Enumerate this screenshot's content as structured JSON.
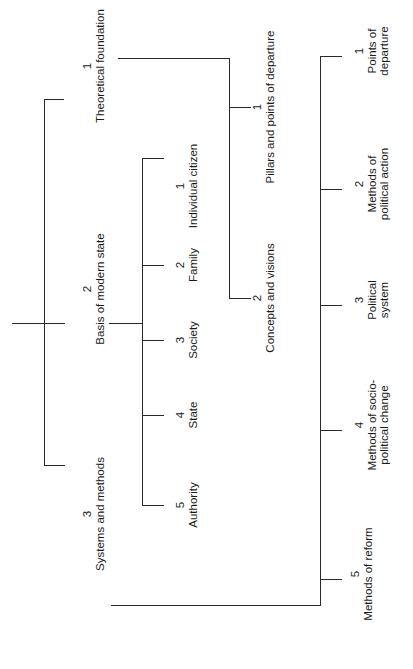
{
  "diagram": {
    "orientation": "rotated-90-ccw",
    "root": {
      "branches": [
        {
          "number": "1",
          "label": "Theoretical foundation"
        },
        {
          "number": "2",
          "label": "Basis of modern state"
        },
        {
          "number": "3",
          "label": "Systems and methods"
        }
      ]
    },
    "basis_of_modern_state": {
      "children": [
        {
          "number": "1",
          "label": "Individual citizen"
        },
        {
          "number": "2",
          "label": "Family"
        },
        {
          "number": "3",
          "label": "Society"
        },
        {
          "number": "4",
          "label": "State"
        },
        {
          "number": "5",
          "label": "Authority"
        }
      ]
    },
    "theoretical_foundation": {
      "children": [
        {
          "number": "1",
          "label": "Pillars and points of departure"
        },
        {
          "number": "2",
          "label": "Concepts and visions"
        }
      ]
    },
    "systems_and_methods": {
      "children": [
        {
          "number": "1",
          "label_lines": [
            "Points of",
            "departure"
          ]
        },
        {
          "number": "2",
          "label_lines": [
            "Methods of",
            "political action"
          ]
        },
        {
          "number": "3",
          "label_lines": [
            "Political",
            "system"
          ]
        },
        {
          "number": "4",
          "label_lines": [
            "Methods of socio-",
            "political change"
          ]
        },
        {
          "number": "5",
          "label_lines": [
            "Methods of reform"
          ]
        }
      ]
    }
  }
}
